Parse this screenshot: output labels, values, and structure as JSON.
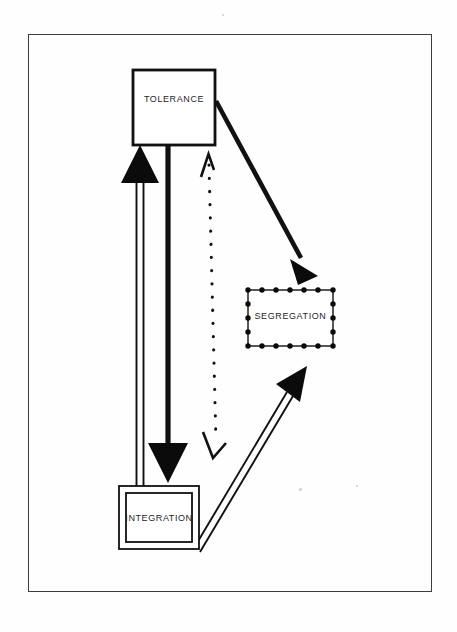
{
  "diagram": {
    "frame": {
      "x": 28,
      "y": 34,
      "width": 404,
      "height": 558,
      "stroke": "#3b3b40"
    },
    "background": "#fefefe",
    "nodes": [
      {
        "id": "tolerance",
        "label": "TOLERANCE",
        "shape": "rectangle",
        "border_style": "solid-thick",
        "x": 133,
        "y": 70,
        "width": 82,
        "height": 75,
        "stroke": "#111111",
        "fill": "#ffffff"
      },
      {
        "id": "segregation",
        "label": "SEGREGATION",
        "shape": "rectangle",
        "border_style": "dotted-beads",
        "x": 248,
        "y": 290,
        "width": 85,
        "height": 56,
        "stroke": "#111111",
        "fill": "#ffffff"
      },
      {
        "id": "integration",
        "label": "INTEGRATION",
        "shape": "rectangle",
        "border_style": "double-line",
        "x": 119,
        "y": 486,
        "width": 80,
        "height": 63,
        "stroke": "#111111",
        "fill": "#ffffff"
      }
    ],
    "edges": [
      {
        "id": "integration-to-tolerance",
        "from": "integration",
        "to": "tolerance",
        "style": "double-line-hollow",
        "head": "filled-triangle-up",
        "direction": "up",
        "stroke": "#111111"
      },
      {
        "id": "tolerance-to-integration",
        "from": "tolerance",
        "to": "integration",
        "style": "solid-thick",
        "head": "filled-triangle-down",
        "direction": "down",
        "stroke": "#111111"
      },
      {
        "id": "tolerance-to-segregation",
        "from": "tolerance",
        "to": "segregation",
        "style": "solid-thick-diagonal",
        "head": "filled-triangle",
        "direction": "down-right",
        "stroke": "#111111"
      },
      {
        "id": "integration-to-segregation",
        "from": "integration",
        "to": "segregation",
        "style": "double-line-hollow-diagonal",
        "head": "filled-triangle",
        "direction": "up-right",
        "stroke": "#111111"
      },
      {
        "id": "tolerance-integration-dotted",
        "from": "tolerance",
        "to": "integration",
        "style": "dotted",
        "head": "open-arrow-both-ends",
        "direction": "bidirectional",
        "stroke": "#111111"
      }
    ]
  }
}
